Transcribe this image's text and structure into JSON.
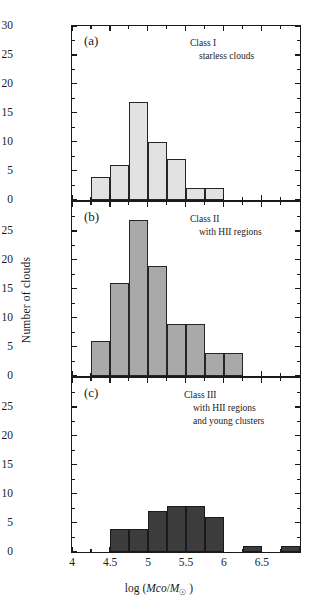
{
  "figure": {
    "xlabel_prefix": "log (",
    "xlabel_mass": "Mco",
    "xlabel_slash": "/",
    "xlabel_msun": "M",
    "xlabel_sun_sub": "☉",
    "xlabel_suffix": " )",
    "ylabel": "Number of clouds"
  },
  "chart_data": {
    "type": "bar",
    "title": "",
    "xlabel": "log (Mco/M☉)",
    "ylabel": "Number of clouds",
    "xlim": [
      4.0,
      7.0
    ],
    "bin_width": 0.25,
    "grid": false,
    "legend": "none",
    "panels": [
      {
        "id": "a",
        "tag": "(a)",
        "note_line1": "Class I",
        "note_line2": "starless clouds",
        "fill_color": "#e2e2e2",
        "edge_color": "#262626",
        "ylim": [
          0,
          30
        ],
        "yticks": [
          0,
          5,
          10,
          15,
          20,
          25,
          30
        ],
        "ytick_labels": [
          "0",
          "5",
          "10",
          "15",
          "20",
          "25",
          "30"
        ],
        "bins": [
          {
            "x0": 4.25,
            "x1": 4.5,
            "value": 4
          },
          {
            "x0": 4.5,
            "x1": 4.75,
            "value": 6
          },
          {
            "x0": 4.75,
            "x1": 5.0,
            "value": 17
          },
          {
            "x0": 5.0,
            "x1": 5.25,
            "value": 10
          },
          {
            "x0": 5.25,
            "x1": 5.5,
            "value": 7
          },
          {
            "x0": 5.5,
            "x1": 5.75,
            "value": 2
          },
          {
            "x0": 5.75,
            "x1": 6.0,
            "value": 2
          }
        ]
      },
      {
        "id": "b",
        "tag": "(b)",
        "note_line1": "Class II",
        "note_line2": "with HII regions",
        "fill_color": "#a9a9a9",
        "edge_color": "#262626",
        "ylim": [
          0,
          30
        ],
        "yticks": [
          0,
          5,
          10,
          15,
          20,
          25
        ],
        "ytick_labels": [
          "0",
          "5",
          "10",
          "15",
          "20",
          "25"
        ],
        "bins": [
          {
            "x0": 4.25,
            "x1": 4.5,
            "value": 6
          },
          {
            "x0": 4.5,
            "x1": 4.75,
            "value": 16
          },
          {
            "x0": 4.75,
            "x1": 5.0,
            "value": 27
          },
          {
            "x0": 5.0,
            "x1": 5.25,
            "value": 19
          },
          {
            "x0": 5.25,
            "x1": 5.5,
            "value": 9
          },
          {
            "x0": 5.5,
            "x1": 5.75,
            "value": 9
          },
          {
            "x0": 5.75,
            "x1": 6.0,
            "value": 4
          },
          {
            "x0": 6.0,
            "x1": 6.25,
            "value": 4
          }
        ]
      },
      {
        "id": "c",
        "tag": "(c)",
        "note_line1": "Class III",
        "note_line2": "with HII regions",
        "note_line3": "and young clusters",
        "fill_color": "#3c3c3c",
        "edge_color": "#1a1a1a",
        "ylim": [
          0,
          30
        ],
        "yticks": [
          0,
          5,
          10,
          15,
          20,
          25
        ],
        "ytick_labels": [
          "0",
          "5",
          "10",
          "15",
          "20",
          "25"
        ],
        "bins": [
          {
            "x0": 4.5,
            "x1": 4.75,
            "value": 4
          },
          {
            "x0": 4.75,
            "x1": 5.0,
            "value": 4
          },
          {
            "x0": 5.0,
            "x1": 5.25,
            "value": 7
          },
          {
            "x0": 5.25,
            "x1": 5.5,
            "value": 8
          },
          {
            "x0": 5.5,
            "x1": 5.75,
            "value": 8
          },
          {
            "x0": 5.75,
            "x1": 6.0,
            "value": 6
          },
          {
            "x0": 6.25,
            "x1": 6.5,
            "value": 1
          },
          {
            "x0": 6.75,
            "x1": 7.0,
            "value": 1
          }
        ]
      }
    ],
    "xticks_major": [
      4.0,
      4.5,
      5.0,
      5.5,
      6.0,
      6.5
    ],
    "xtick_labels": [
      "4",
      "4.5",
      "5",
      "5.5",
      "6",
      "6.5"
    ],
    "xticks_minor": [
      4.25,
      4.75,
      5.25,
      5.75,
      6.25,
      6.75
    ]
  }
}
